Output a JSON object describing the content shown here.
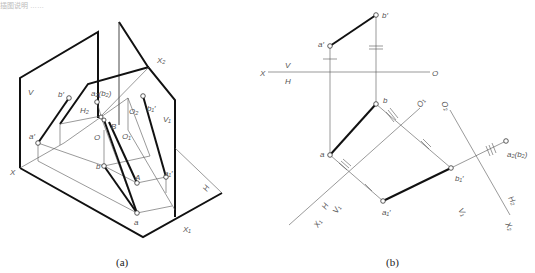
{
  "header_remnant": "插图说明 ……",
  "figure_a": {
    "caption": "(a)",
    "labels": {
      "V": "V",
      "X": "X",
      "X1": "X₁",
      "X2": "X₂",
      "V1": "V₁",
      "H": "H",
      "H2": "H₂",
      "a_prime": "a′",
      "b_prime": "b′",
      "a2b2": "a₂(b₂)",
      "b1_prime": "b₁′",
      "a1_prime": "a₁′",
      "O": "O",
      "O1": "O₁",
      "O2": "O₂",
      "B": "B",
      "A": "A",
      "a": "a",
      "b": "b"
    }
  },
  "figure_b": {
    "caption": "(b)",
    "labels": {
      "X": "X",
      "V": "V",
      "H": "H",
      "O": "O",
      "a_prime": "a′",
      "b_prime": "b′",
      "a": "a",
      "b": "b",
      "O1": "O₁",
      "O2": "O₂",
      "a2b2": "a₂(b₂)",
      "b1_prime": "b₁′",
      "a1_prime": "a₁′",
      "X1": "X₁",
      "H_lower": "H",
      "V1_lower": "V₁",
      "V1_right": "V₁",
      "H2": "H₂",
      "X2": "X₂"
    }
  }
}
